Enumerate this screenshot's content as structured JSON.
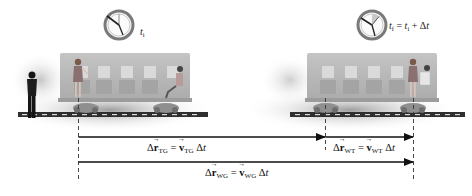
{
  "scene": {
    "description": "Relative motion diagram: woman walking in a moving train car observed from the ground",
    "colors": {
      "train_body": "#b9b9b9",
      "train_window": "#d9d9d9",
      "track": "#3a3a3a",
      "shadow": "#9a9a9a",
      "arrow": "#111111"
    }
  },
  "clocks": [
    {
      "id": "initial",
      "label_var": "t",
      "label_sub": "i"
    },
    {
      "id": "final",
      "label_var": "t",
      "label_sub": "f",
      "eq": "=",
      "rhs_var": "t",
      "rhs_sub": "i",
      "plus": "+ Δ",
      "rhs_tail": "t"
    }
  ],
  "vectors": {
    "tg": {
      "delta": "Δ",
      "r": "r",
      "sub": "TG",
      "eq": "=",
      "v": "v",
      "vsub": "TG",
      "dt": "Δ",
      "t": "t"
    },
    "wt": {
      "delta": "Δ",
      "r": "r",
      "sub": "WT",
      "eq": "=",
      "v": "v",
      "vsub": "WT",
      "dt": "Δ",
      "t": "t"
    },
    "wg": {
      "delta": "Δ",
      "r": "r",
      "sub": "WG",
      "eq": "=",
      "v": "v",
      "vsub": "WG",
      "dt": "Δ",
      "t": "t"
    }
  }
}
